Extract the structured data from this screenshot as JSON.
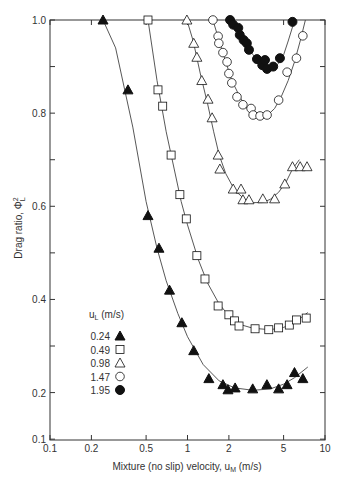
{
  "chart_data": {
    "type": "scatter",
    "title": "",
    "xlabel": "Mixture (no slip) velocity, u_M (m/s)",
    "ylabel": "Drag ratio, ΦL²",
    "xscale": "log",
    "yscale": "linear",
    "xlim": [
      0.1,
      10
    ],
    "ylim": [
      0.1,
      1.0
    ],
    "x_ticks": [
      0.1,
      0.2,
      0.5,
      1,
      2,
      5,
      10
    ],
    "x_tick_labels": [
      "0.1",
      "0.2",
      "0.5",
      "1",
      "2",
      "5",
      "10"
    ],
    "y_ticks_labeled": [
      0.1,
      0.2,
      0.4,
      0.6,
      0.8,
      1.0
    ],
    "y_tick_labels": [
      "0.1",
      "0.2",
      "0.4",
      "0.6",
      "0.8",
      "1.0"
    ],
    "y_minor_ticks": [
      0.3,
      0.5,
      0.7,
      0.9
    ],
    "grid": false,
    "legend_title": "u_L (m/s)",
    "legend_position": "lower-left inside",
    "series": [
      {
        "name": "0.24",
        "marker": "filled-triangle",
        "x": [
          0.243,
          0.369,
          0.516,
          0.62,
          0.74,
          0.91,
          1.11,
          1.43,
          1.81,
          1.97,
          2.22,
          2.98,
          3.78,
          4.6,
          5.3,
          6.0,
          6.9
        ],
        "y": [
          1.0,
          0.85,
          0.58,
          0.51,
          0.42,
          0.35,
          0.29,
          0.23,
          0.217,
          0.206,
          0.21,
          0.208,
          0.217,
          0.208,
          0.217,
          0.243,
          0.23
        ],
        "fit_curve": {
          "x": [
            0.243,
            0.3,
            0.4,
            0.5,
            0.6,
            0.7,
            0.85,
            1.0,
            1.3,
            1.7,
            2.2,
            3.0,
            4.0,
            5.0,
            6.0,
            7.5
          ],
          "y": [
            1.0,
            0.94,
            0.77,
            0.61,
            0.51,
            0.44,
            0.37,
            0.32,
            0.26,
            0.225,
            0.21,
            0.205,
            0.208,
            0.218,
            0.232,
            0.255
          ]
        }
      },
      {
        "name": "0.49",
        "marker": "open-square",
        "x": [
          0.516,
          0.61,
          0.66,
          0.76,
          0.88,
          0.98,
          1.17,
          1.34,
          1.67,
          2.0,
          2.2,
          2.37,
          3.1,
          3.9,
          4.6,
          5.5,
          6.2,
          7.3
        ],
        "y": [
          1.0,
          0.85,
          0.815,
          0.71,
          0.625,
          0.573,
          0.494,
          0.444,
          0.386,
          0.367,
          0.354,
          0.343,
          0.337,
          0.335,
          0.339,
          0.345,
          0.356,
          0.36
        ],
        "fit_curve": {
          "x": [
            0.516,
            0.6,
            0.7,
            0.8,
            0.9,
            1.0,
            1.2,
            1.4,
            1.7,
            2.0,
            2.5,
            3.0,
            4.0,
            5.0,
            6.0,
            7.5
          ],
          "y": [
            1.0,
            0.87,
            0.76,
            0.68,
            0.61,
            0.56,
            0.485,
            0.435,
            0.39,
            0.365,
            0.345,
            0.338,
            0.335,
            0.34,
            0.35,
            0.372
          ]
        }
      },
      {
        "name": "0.98",
        "marker": "open-triangle",
        "x": [
          0.99,
          1.11,
          1.17,
          1.27,
          1.41,
          1.51,
          1.67,
          1.72,
          2.15,
          2.45,
          2.53,
          2.8,
          3.53,
          4.3,
          5.1,
          5.8,
          6.6,
          7.4
        ],
        "y": [
          1.0,
          0.95,
          0.92,
          0.87,
          0.83,
          0.79,
          0.71,
          0.68,
          0.637,
          0.637,
          0.614,
          0.614,
          0.616,
          0.616,
          0.648,
          0.685,
          0.685,
          0.685
        ],
        "fit_curve": {
          "x": [
            0.99,
            1.1,
            1.25,
            1.4,
            1.55,
            1.7,
            1.9,
            2.2,
            2.6,
            3.0,
            3.5,
            4.0,
            4.6,
            5.2,
            5.8,
            6.5
          ],
          "y": [
            1.0,
            0.955,
            0.88,
            0.82,
            0.76,
            0.71,
            0.67,
            0.635,
            0.615,
            0.608,
            0.608,
            0.615,
            0.63,
            0.652,
            0.68,
            0.7
          ]
        }
      },
      {
        "name": "1.47",
        "marker": "open-circle",
        "x": [
          1.53,
          1.67,
          1.69,
          1.81,
          1.94,
          2.0,
          2.1,
          2.29,
          2.53,
          2.9,
          3.0,
          3.37,
          3.79,
          4.6,
          5.3,
          6.2,
          6.9
        ],
        "y": [
          1.0,
          0.965,
          0.95,
          0.93,
          0.91,
          0.885,
          0.865,
          0.835,
          0.818,
          0.81,
          0.796,
          0.794,
          0.796,
          0.828,
          0.888,
          0.918,
          0.966
        ],
        "fit_curve": {
          "x": [
            1.53,
            1.7,
            1.9,
            2.1,
            2.4,
            2.7,
            3.0,
            3.4,
            3.8,
            4.3,
            4.8,
            5.4,
            6.0,
            6.6,
            7.2
          ],
          "y": [
            1.0,
            0.955,
            0.91,
            0.87,
            0.835,
            0.81,
            0.798,
            0.792,
            0.795,
            0.81,
            0.835,
            0.87,
            0.91,
            0.955,
            1.0
          ]
        }
      },
      {
        "name": "1.95",
        "marker": "filled-circle",
        "x": [
          2.04,
          2.15,
          2.34,
          2.4,
          2.56,
          2.7,
          2.8,
          3.2,
          3.5,
          3.66,
          3.79,
          4.2,
          4.7,
          5.8
        ],
        "y": [
          1.0,
          0.99,
          0.983,
          0.968,
          0.957,
          0.95,
          0.936,
          0.916,
          0.903,
          0.914,
          0.895,
          0.9,
          0.918,
          0.996
        ],
        "fit_curve": {
          "x": [
            2.1,
            2.4,
            2.7,
            3.0,
            3.4,
            3.8,
            4.2,
            4.6,
            5.0,
            5.4,
            5.8,
            6.1
          ],
          "y": [
            1.0,
            0.97,
            0.945,
            0.925,
            0.905,
            0.897,
            0.897,
            0.907,
            0.925,
            0.955,
            0.985,
            1.0
          ]
        }
      }
    ]
  },
  "axes": {
    "xlabel_main": "Mixture (no slip) velocity, u",
    "xlabel_sub": "M",
    "xlabel_units": " (m/s)",
    "ylabel_main": "Drag ratio, Φ",
    "ylabel_sup": "2",
    "ylabel_sub": "L"
  },
  "legend": {
    "title_main": "u",
    "title_sub": "L",
    "title_units": " (m/s)",
    "entries": [
      "0.24",
      "0.49",
      "0.98",
      "1.47",
      "1.95"
    ]
  },
  "colors": {
    "ink": "#111111",
    "axis": "#333333",
    "curve": "#444444",
    "background": "#ffffff"
  }
}
